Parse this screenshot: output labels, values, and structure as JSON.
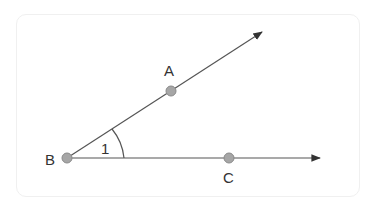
{
  "diagram": {
    "type": "geometry-angle",
    "points": {
      "A": {
        "label": "A",
        "x": 171,
        "y": 91
      },
      "B": {
        "label": "B",
        "x": 67,
        "y": 158
      },
      "C": {
        "label": "C",
        "x": 229,
        "y": 158
      }
    },
    "rays": [
      {
        "name": "ray-BA",
        "from": "B",
        "through": "A",
        "arrow": true
      },
      {
        "name": "ray-BC",
        "from": "B",
        "through": "C",
        "arrow": true
      }
    ],
    "angle": {
      "vertex": "B",
      "label": "1"
    },
    "colors": {
      "line": "#555555",
      "point_fill": "#a6a6a6",
      "point_stroke": "#8a8a8a",
      "text": "#333333"
    }
  }
}
